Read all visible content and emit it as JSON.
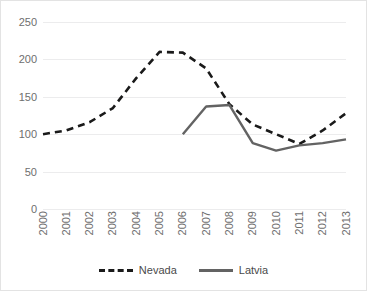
{
  "chart_data": {
    "type": "line",
    "title": "",
    "subtitle": "",
    "xlabel": "",
    "ylabel": "",
    "categories": [
      "2000",
      "2001",
      "2002",
      "2003",
      "2004",
      "2005",
      "2006",
      "2007",
      "2008",
      "2009",
      "2010",
      "2011",
      "2012",
      "2013"
    ],
    "x": [
      2000,
      2001,
      2002,
      2003,
      2004,
      2005,
      2006,
      2007,
      2008,
      2009,
      2010,
      2011,
      2012,
      2013
    ],
    "ylim": [
      0,
      250
    ],
    "yticks": [
      0,
      50,
      100,
      150,
      200,
      250
    ],
    "ytick_labels": [
      "0",
      "50",
      "100",
      "150",
      "200",
      "250"
    ],
    "grid": "horizontal",
    "legend_position": "bottom",
    "series": [
      {
        "name": "Nevada",
        "style": "dashed",
        "color": "#1a1a1a",
        "values": [
          100,
          105,
          116,
          135,
          175,
          210,
          209,
          188,
          140,
          113,
          100,
          87,
          105,
          128
        ]
      },
      {
        "name": "Latvia",
        "style": "solid",
        "color": "#636363",
        "values": [
          null,
          null,
          null,
          null,
          null,
          null,
          100,
          137,
          139,
          88,
          78,
          85,
          88,
          93
        ]
      }
    ]
  },
  "legend": {
    "items": [
      {
        "label": "Nevada",
        "swatch": "dashed-line-swatch"
      },
      {
        "label": "Latvia",
        "swatch": "solid-line-swatch"
      }
    ]
  },
  "colors": {
    "nevada": "#1a1a1a",
    "latvia": "#636363",
    "gridline": "#ececed",
    "tick_text": "#6e6e6e",
    "frame_border": "#e3e3e3",
    "background": "#ffffff"
  }
}
